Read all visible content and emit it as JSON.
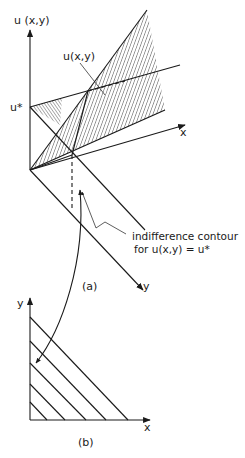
{
  "figure_a": {
    "axis_u_label": "u (x,y)",
    "axis_x_label": "x",
    "axis_y_label": "y",
    "u_star_label": "u*",
    "surface_label": "u(x,y)",
    "contour_label_line1": "indifference contour",
    "contour_label_line2": "for  u(x,y) = u*",
    "caption": "(a)"
  },
  "figure_b": {
    "axis_y_label": "y",
    "axis_x_label": "x",
    "caption": "(b)",
    "contour_count": 6
  }
}
